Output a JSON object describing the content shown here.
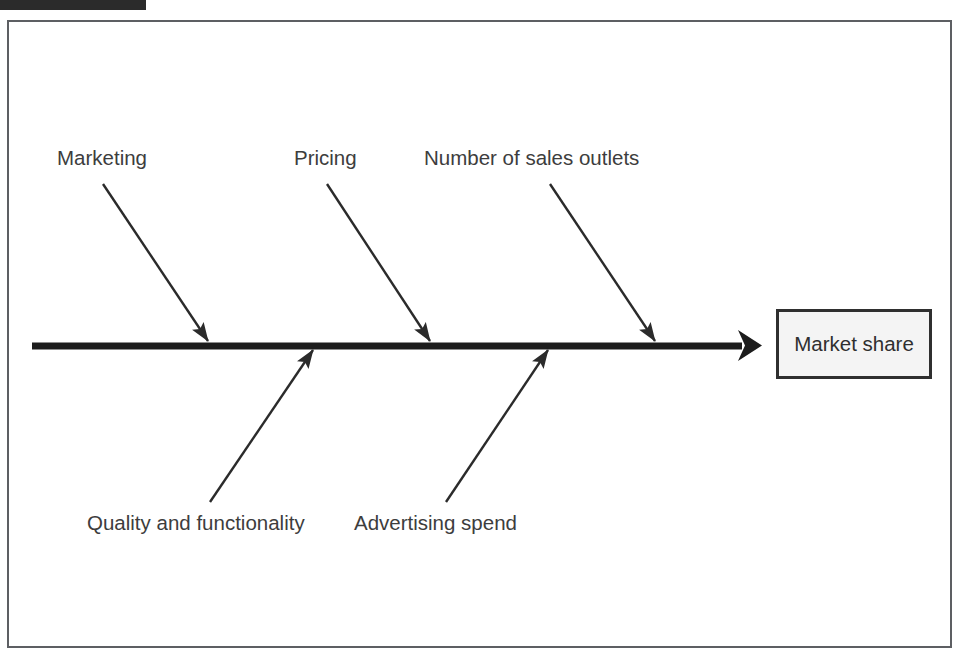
{
  "diagram": {
    "type": "fishbone-ishikawa",
    "title_bar_cropped": true,
    "effect": {
      "label": "Market share"
    },
    "spine": {
      "color": "#1c1c1c",
      "thickness_px": 7,
      "start_x": 32,
      "end_x": 762,
      "y": 346,
      "direction": "left-to-right"
    },
    "causes": [
      {
        "id": "marketing",
        "label": "Marketing",
        "side": "top",
        "label_x": 57,
        "label_y": 148,
        "arrow_from_x": 103,
        "arrow_from_y": 184,
        "arrow_to_x": 208,
        "arrow_to_y": 341
      },
      {
        "id": "pricing",
        "label": "Pricing",
        "side": "top",
        "label_x": 294,
        "label_y": 148,
        "arrow_from_x": 327,
        "arrow_from_y": 184,
        "arrow_to_x": 430,
        "arrow_to_y": 341
      },
      {
        "id": "sales-outlets",
        "label": "Number of sales outlets",
        "side": "top",
        "label_x": 424,
        "label_y": 148,
        "arrow_from_x": 550,
        "arrow_from_y": 184,
        "arrow_to_x": 655,
        "arrow_to_y": 341
      },
      {
        "id": "quality",
        "label": "Quality and functionality",
        "side": "bottom",
        "label_x": 87,
        "label_y": 513,
        "arrow_from_x": 210,
        "arrow_from_y": 502,
        "arrow_to_x": 313,
        "arrow_to_y": 350
      },
      {
        "id": "advertising",
        "label": "Advertising spend",
        "side": "bottom",
        "label_x": 354,
        "label_y": 513,
        "arrow_from_x": 446,
        "arrow_from_y": 502,
        "arrow_to_x": 548,
        "arrow_to_y": 350
      }
    ],
    "colors": {
      "line": "#1c1c1c",
      "bone": "#2b2b2b",
      "text": "#3d3d3d",
      "frame_border": "#5d5f63",
      "box_border": "#2f2f2f",
      "box_fill": "#f4f4f4",
      "background": "#ffffff",
      "crop_bar": "#2b2b2b"
    }
  }
}
